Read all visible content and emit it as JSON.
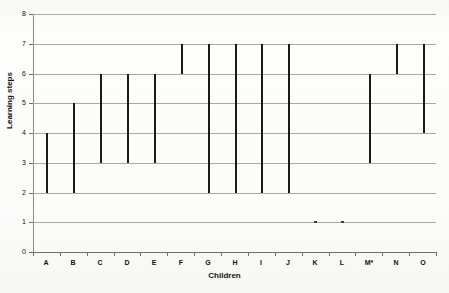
{
  "chart_data": {
    "type": "bar",
    "subtype": "floating-range-bars",
    "title": "",
    "xlabel": "Children",
    "ylabel": "Learning steps",
    "categories": [
      "A",
      "B",
      "C",
      "D",
      "E",
      "F",
      "G",
      "H",
      "I",
      "J",
      "K",
      "L",
      "M*",
      "N",
      "O"
    ],
    "ylim": [
      0,
      8
    ],
    "yticks": [
      0,
      1,
      2,
      3,
      4,
      5,
      6,
      7,
      8
    ],
    "ytick_labels": [
      "0",
      "1",
      "2",
      "3",
      "4",
      "5",
      "6",
      "7",
      "8"
    ],
    "grid": true,
    "grid_axis": "y",
    "legend": false,
    "series": [
      {
        "name": "Learning step range",
        "low": [
          2,
          2,
          3,
          3,
          3,
          6,
          2,
          2,
          2,
          2,
          1,
          1,
          3,
          6,
          4
        ],
        "high": [
          4,
          5,
          6,
          6,
          6,
          7,
          7,
          7,
          7,
          7,
          1,
          1,
          6,
          7,
          7
        ]
      }
    ],
    "ranges": [
      {
        "category": "A",
        "low": 2,
        "high": 4
      },
      {
        "category": "B",
        "low": 2,
        "high": 5
      },
      {
        "category": "C",
        "low": 3,
        "high": 6
      },
      {
        "category": "D",
        "low": 3,
        "high": 6
      },
      {
        "category": "E",
        "low": 3,
        "high": 6
      },
      {
        "category": "F",
        "low": 6,
        "high": 7
      },
      {
        "category": "G",
        "low": 2,
        "high": 7
      },
      {
        "category": "H",
        "low": 2,
        "high": 7
      },
      {
        "category": "I",
        "low": 2,
        "high": 7
      },
      {
        "category": "J",
        "low": 2,
        "high": 7
      },
      {
        "category": "K",
        "low": 1,
        "high": 1
      },
      {
        "category": "L",
        "low": 1,
        "high": 1
      },
      {
        "category": "M*",
        "low": 3,
        "high": 6
      },
      {
        "category": "N",
        "low": 6,
        "high": 7
      },
      {
        "category": "O",
        "low": 4,
        "high": 7
      }
    ],
    "colors": {
      "bar": "#1a1a1a",
      "grid": "#a9a9a9",
      "axis": "#6f6f6f",
      "background": "#fdfdfc",
      "text": "#111111"
    }
  }
}
